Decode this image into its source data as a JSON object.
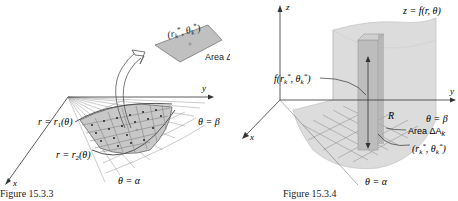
{
  "figure_left": {
    "caption": "Figure 15.3.3",
    "axis_x": "x",
    "axis_y": "y",
    "label_r1": "r = r₁(θ)",
    "label_r2": "r = r₂(θ)",
    "label_beta": "θ = β",
    "label_alpha": "θ = α",
    "inset_point": "(r*k, θ*k)",
    "inset_area": "Area ΔA",
    "inset_area_sub": "k"
  },
  "figure_right": {
    "caption": "Figure 15.3.4",
    "axis_x": "x",
    "axis_y": "y",
    "axis_z": "z",
    "surface_label": "z = f(r, θ)",
    "height_label": "f(r*k, θ*k)",
    "region_label": "R",
    "label_beta": "θ = β",
    "label_alpha": "θ = α",
    "area_label": "Area ΔA",
    "area_sub": "k",
    "point_label": "(r*k, θ*k)"
  },
  "colors": {
    "region_fill": "#c8c8c8",
    "grid_line": "#888888",
    "surface_fill": "#d8d8d8",
    "point": "#222222"
  }
}
